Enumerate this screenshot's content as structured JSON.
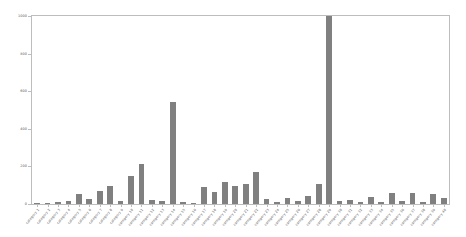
{
  "figure": {
    "background": "#ffffff",
    "frame_color": "#bdbdbd",
    "bar_color": "#808080"
  },
  "chart_data": {
    "type": "bar",
    "title": "",
    "xlabel": "",
    "ylabel": "",
    "ylim": [
      0,
      1000
    ],
    "yticks": [
      0,
      200,
      400,
      600,
      800,
      1000
    ],
    "ytick_labels": [
      "0",
      "200",
      "400",
      "600",
      "800",
      "1000"
    ],
    "grid": false,
    "legend": null,
    "xtick_rotation": -50,
    "categories": [
      "category 1",
      "category 2",
      "category 3",
      "category 4",
      "category 5",
      "category 6",
      "category 7",
      "category 8",
      "category 9",
      "category 10",
      "category 11",
      "category 12",
      "category 13",
      "category 14",
      "category 15",
      "category 16",
      "category 17",
      "category 18",
      "category 19",
      "category 20",
      "category 21",
      "category 22",
      "category 23",
      "category 24",
      "category 25",
      "category 26",
      "category 27",
      "category 28",
      "category 29",
      "category 30",
      "category 31",
      "category 32",
      "category 33",
      "category 34",
      "category 35",
      "category 36",
      "category 37",
      "category 38",
      "category 39",
      "category 40"
    ],
    "values": [
      8,
      6,
      10,
      14,
      52,
      28,
      70,
      96,
      18,
      150,
      215,
      22,
      14,
      540,
      10,
      8,
      90,
      62,
      118,
      96,
      104,
      170,
      26,
      12,
      30,
      16,
      44,
      108,
      1000,
      14,
      20,
      10,
      36,
      12,
      56,
      14,
      60,
      10,
      52,
      30
    ]
  }
}
